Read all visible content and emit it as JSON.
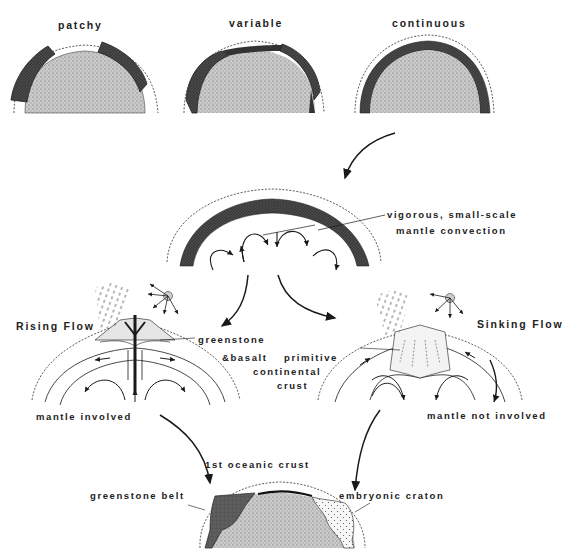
{
  "figure": {
    "top_row": {
      "panels": [
        {
          "label": "patchy"
        },
        {
          "label": "variable"
        },
        {
          "label": "continuous"
        }
      ]
    },
    "convection": {
      "label_line1": "vigorous, small-scale",
      "label_line2": "mantle convection"
    },
    "rising_flow": {
      "title": "Rising Flow",
      "greenstone_label": "greenstone",
      "basalt_label": "&basalt",
      "melt_label": "melt",
      "bottom_label": "mantle involved"
    },
    "sinking_flow": {
      "title": "Sinking Flow",
      "crust_label_line1": "primitive",
      "crust_label_line2": "continental",
      "crust_label_line3": "crust",
      "melt_label": "melt",
      "bottom_label": "mantle not involved"
    },
    "result": {
      "title": "1st oceanic crust",
      "left_label": "greenstone belt",
      "right_label": "embryonic craton"
    },
    "colors": {
      "mantle_stipple": "#bdbdbd",
      "crust_dark": "#3a3a3a",
      "greenstone": "#5a5a5a",
      "craton": "#f2f2f2",
      "line": "#1a1a1a"
    }
  }
}
